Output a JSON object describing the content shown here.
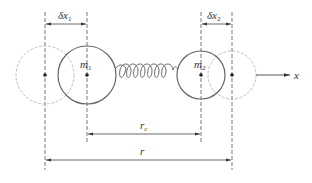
{
  "diagram": {
    "type": "two-mass spring system displacement",
    "colors": {
      "line": "#444444",
      "dashed_circle": "#b8b8b8",
      "solid_circle": "#666666",
      "background": "#ffffff"
    },
    "labels": {
      "delta_x1": "δx",
      "delta_x1_sub": "1",
      "delta_x2": "δx",
      "delta_x2_sub": "2",
      "m1": "m",
      "m1_sub": "1",
      "m2": "m",
      "m2_sub": "2",
      "axis": "x",
      "rc": "r",
      "rc_sub": "c",
      "r": "r"
    },
    "nodes": [
      {
        "id": "m1-original",
        "style": "dashed",
        "cx": 45,
        "cy": 75,
        "r": 29
      },
      {
        "id": "m1",
        "style": "solid",
        "cx": 87,
        "cy": 75,
        "r": 29
      },
      {
        "id": "m2",
        "style": "solid",
        "cx": 201,
        "cy": 75,
        "r": 24
      },
      {
        "id": "m2-displaced",
        "style": "dashed",
        "cx": 232,
        "cy": 75,
        "r": 24
      }
    ],
    "edges": [
      {
        "from": "m1",
        "to": "m2",
        "kind": "spring",
        "coils": 7
      }
    ],
    "dimensions": [
      {
        "label": "δx1",
        "from_x": 45,
        "to_x": 87,
        "y": 24
      },
      {
        "label": "δx2",
        "from_x": 201,
        "to_x": 232,
        "y": 24
      },
      {
        "label": "rc",
        "from_x": 87,
        "to_x": 201,
        "y": 134
      },
      {
        "label": "r",
        "from_x": 45,
        "to_x": 232,
        "y": 160
      }
    ]
  }
}
